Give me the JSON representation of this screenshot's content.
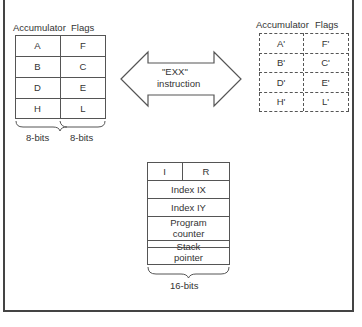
{
  "main_registers": {
    "header_accumulator": "Accumulator",
    "header_flags": "Flags",
    "rows": [
      {
        "acc": "A",
        "flag": "F"
      },
      {
        "acc": "B",
        "flag": "C"
      },
      {
        "acc": "D",
        "flag": "E"
      },
      {
        "acc": "H",
        "flag": "L"
      }
    ],
    "brace_left_label": "8-bits",
    "brace_right_label": "8-bits"
  },
  "alternate_registers": {
    "header_accumulator": "Accumulator",
    "header_flags": "Flags",
    "rows": [
      {
        "acc": "A'",
        "flag": "F'"
      },
      {
        "acc": "B'",
        "flag": "C'"
      },
      {
        "acc": "D'",
        "flag": "E'"
      },
      {
        "acc": "H'",
        "flag": "L'"
      }
    ]
  },
  "exchange_arrow": {
    "line1": "\"EXX\"",
    "line2": "instruction"
  },
  "special_registers": {
    "i": "I",
    "r": "R",
    "ix": "Index IX",
    "iy": "Index IY",
    "pc_line1": "Program",
    "pc_line2": "counter",
    "sp_line1": "Stack",
    "sp_line2": "pointer",
    "brace_label": "16-bits"
  }
}
